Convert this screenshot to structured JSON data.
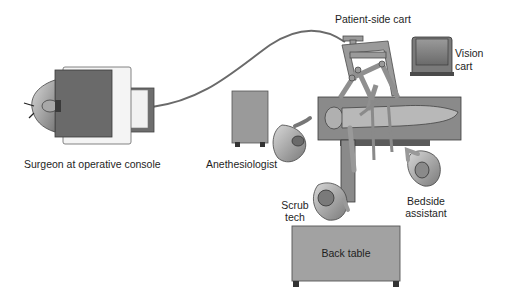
{
  "diagram": {
    "labels": {
      "patient_side_cart": "Patient-side cart",
      "vision_cart_line1": "Vision",
      "vision_cart_line2": "cart",
      "surgeon_console": "Surgeon at operative console",
      "anesthesiologist": "Anethesiologist",
      "scrub_tech_line1": "Scrub",
      "scrub_tech_line2": "tech",
      "bedside_assistant_line1": "Bedside",
      "bedside_assistant_line2": "assistant",
      "back_table": "Back table"
    },
    "colors": {
      "background": "#ffffff",
      "dark_gray": "#5f5f5f",
      "mid_gray": "#8c8c8c",
      "light_gray": "#b4b4b4",
      "pale": "#e8e8e8",
      "outline": "#3a3a3a",
      "text": "#1e1e1e"
    }
  }
}
